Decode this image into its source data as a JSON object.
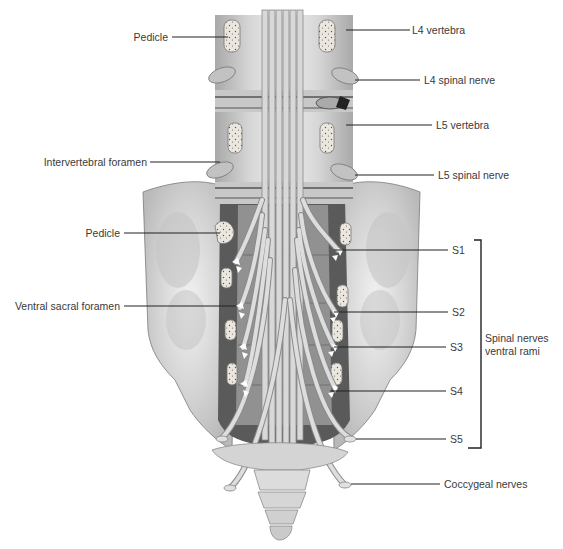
{
  "figure": {
    "colors": {
      "background": "#ffffff",
      "bone_light": "#e4e4e4",
      "bone_mid": "#bdbdbd",
      "bone_dark": "#8f8f8f",
      "foramen_dark": "#4a4a4a",
      "nerve": "#cfcfcf",
      "nerve_edge": "#8a8a8a",
      "leader_line": "#222222",
      "label_text": "#3a3a3a"
    }
  },
  "labels_left": [
    {
      "id": "pedicle-upper",
      "text": "Pedicle",
      "y": 37
    },
    {
      "id": "intervertebral-foramen",
      "text": "Intervertebral foramen",
      "y": 162
    },
    {
      "id": "pedicle-lower",
      "text": "Pedicle",
      "y": 233
    },
    {
      "id": "ventral-sacral-foramen",
      "text": "Ventral sacral foramen",
      "y": 306
    }
  ],
  "labels_right": [
    {
      "id": "l4-vertebra",
      "text": "L4 vertebra",
      "y": 30
    },
    {
      "id": "l4-spinal-nerve",
      "text": "L4 spinal nerve",
      "y": 80
    },
    {
      "id": "l5-vertebra",
      "text": "L5 vertebra",
      "y": 125
    },
    {
      "id": "l5-spinal-nerve",
      "text": "L5 spinal nerve",
      "y": 175
    },
    {
      "id": "s1",
      "text": "S1",
      "y": 250
    },
    {
      "id": "s2",
      "text": "S2",
      "y": 312
    },
    {
      "id": "s3",
      "text": "S3",
      "y": 347
    },
    {
      "id": "s4",
      "text": "S4",
      "y": 391
    },
    {
      "id": "s5",
      "text": "S5",
      "y": 439
    },
    {
      "id": "coccygeal-nerves",
      "text": "Coccygeal nerves",
      "y": 484
    }
  ],
  "bracket": {
    "label_line1": "Spinal nerves",
    "label_line2": "ventral rami",
    "spans": [
      "S1",
      "S2",
      "S3",
      "S4",
      "S5"
    ]
  }
}
